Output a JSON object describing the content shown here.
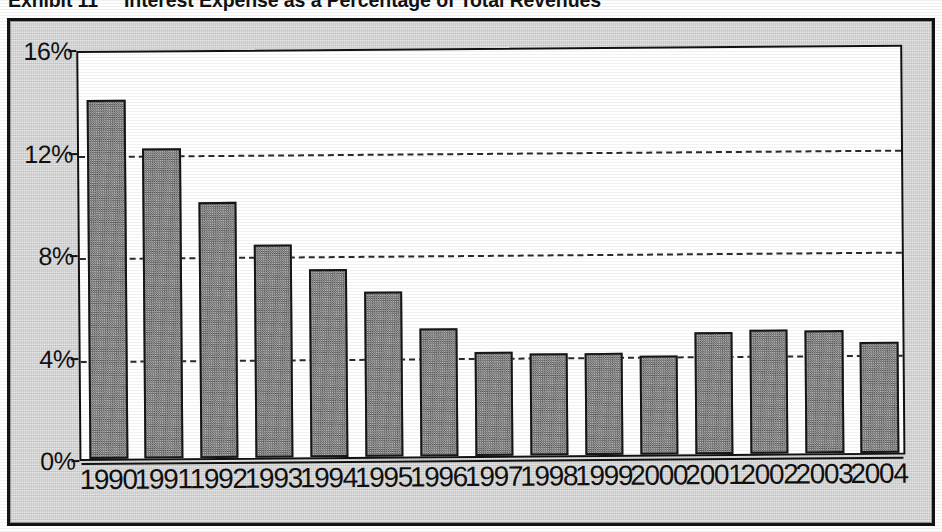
{
  "title": {
    "exhibit_label": "Exhibit 11",
    "caption": "Interest Expense as a Percentage of Total Revenues"
  },
  "chart_data": {
    "type": "bar",
    "title": "Interest Expense as a Percentage of Total Revenues",
    "xlabel": "",
    "ylabel": "",
    "ylim": [
      0,
      16
    ],
    "yunit": "%",
    "grid": true,
    "gridlines": [
      0,
      4,
      8,
      12,
      16
    ],
    "legend": "none",
    "categories": [
      "1990",
      "1991",
      "1992",
      "1993",
      "1994",
      "1995",
      "1996",
      "1997",
      "1998",
      "1999",
      "2000",
      "2001",
      "2002",
      "2003",
      "2004"
    ],
    "values": [
      14.0,
      12.1,
      10.0,
      8.3,
      7.35,
      6.45,
      5.0,
      4.05,
      4.0,
      4.0,
      3.85,
      4.75,
      4.85,
      4.8,
      4.35
    ],
    "ytick_labels": [
      "0%",
      "4%",
      "8%",
      "12%",
      "16%"
    ],
    "ytick_values": [
      0,
      4,
      8,
      12,
      16
    ],
    "bar_fill_color": "#8e8e8e",
    "bar_border_color": "#161616",
    "plot_background_color": "#ffffff",
    "figure_background_color": "#c9c9c9",
    "gridline_color": "#2a2a2a"
  }
}
